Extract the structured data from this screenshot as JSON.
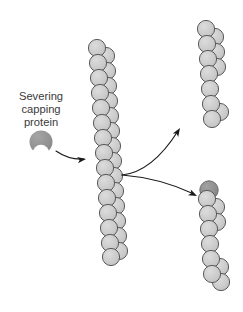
{
  "diagram": {
    "background_color": "#ffffff",
    "label": {
      "name": "severing-capping-protein-label",
      "lines": [
        "Severing",
        "capping",
        "protein"
      ],
      "line1": "Severing",
      "line2": "capping",
      "line3": "protein",
      "color": "#3a3a3a",
      "font_size_px": 11.2,
      "center_x": 41,
      "line_y": [
        97,
        110,
        123
      ]
    },
    "colors": {
      "subunit_fill": "#c9c9c9",
      "subunit_fill_light": "#d2d2d2",
      "subunit_stroke": "#5a5a5a",
      "protein_fill": "#8f8f8f",
      "protein_stroke": "#6e6e6e",
      "cap_fill": "#8c8c8c",
      "cap_stroke": "#6b6b6b",
      "arrow_color": "#1a1a1a",
      "text_color": "#3a3a3a",
      "background": "#ffffff"
    },
    "severing_protein_icon": {
      "name": "severing-capping-protein-icon",
      "shape": "crescent",
      "cx": 41,
      "cy": 142,
      "r": 11.5,
      "notch_cx": 41,
      "notch_cy": 153,
      "notch_r": 8.2,
      "fill": "#8f8f8f"
    },
    "filaments": [
      {
        "name": "intact-actin-filament",
        "role": "intact",
        "subunit_radius": 8.6,
        "subunits": [
          {
            "x": 97,
            "y": 48,
            "side": "left"
          },
          {
            "x": 106,
            "y": 56,
            "side": "right"
          },
          {
            "x": 98,
            "y": 63,
            "side": "left"
          },
          {
            "x": 107,
            "y": 71,
            "side": "right"
          },
          {
            "x": 99,
            "y": 78,
            "side": "left"
          },
          {
            "x": 108,
            "y": 86,
            "side": "right"
          },
          {
            "x": 100,
            "y": 93,
            "side": "left"
          },
          {
            "x": 109,
            "y": 101,
            "side": "right"
          },
          {
            "x": 101,
            "y": 108,
            "side": "left"
          },
          {
            "x": 110,
            "y": 116,
            "side": "right"
          },
          {
            "x": 102,
            "y": 123,
            "side": "left"
          },
          {
            "x": 111,
            "y": 131,
            "side": "right"
          },
          {
            "x": 103,
            "y": 138,
            "side": "left"
          },
          {
            "x": 112,
            "y": 146,
            "side": "right"
          },
          {
            "x": 104,
            "y": 153,
            "side": "left"
          },
          {
            "x": 113,
            "y": 161,
            "side": "right"
          },
          {
            "x": 105,
            "y": 168,
            "side": "left"
          },
          {
            "x": 114,
            "y": 176,
            "side": "right"
          },
          {
            "x": 106,
            "y": 183,
            "side": "left"
          },
          {
            "x": 115,
            "y": 191,
            "side": "right"
          },
          {
            "x": 107,
            "y": 198,
            "side": "left"
          },
          {
            "x": 116,
            "y": 206,
            "side": "right"
          },
          {
            "x": 108,
            "y": 213,
            "side": "left"
          },
          {
            "x": 117,
            "y": 221,
            "side": "right"
          },
          {
            "x": 109,
            "y": 228,
            "side": "left"
          },
          {
            "x": 118,
            "y": 236,
            "side": "right"
          },
          {
            "x": 110,
            "y": 243,
            "side": "left"
          },
          {
            "x": 119,
            "y": 251,
            "side": "right"
          },
          {
            "x": 111,
            "y": 257,
            "side": "left"
          }
        ]
      },
      {
        "name": "severed-fragment-uncapped",
        "role": "fragment-uncapped",
        "subunit_radius": 8.6,
        "subunits": [
          {
            "x": 206,
            "y": 29,
            "side": "left"
          },
          {
            "x": 215,
            "y": 37,
            "side": "right"
          },
          {
            "x": 207,
            "y": 44,
            "side": "left"
          },
          {
            "x": 216,
            "y": 52,
            "side": "right"
          },
          {
            "x": 208,
            "y": 59,
            "side": "left"
          },
          {
            "x": 217,
            "y": 67,
            "side": "right"
          },
          {
            "x": 209,
            "y": 74,
            "side": "left"
          },
          {
            "x": 210,
            "y": 89,
            "side": "left"
          },
          {
            "x": 211,
            "y": 104,
            "side": "left"
          },
          {
            "x": 220,
            "y": 112,
            "side": "right"
          },
          {
            "x": 212,
            "y": 119,
            "side": "left"
          }
        ]
      },
      {
        "name": "severed-fragment-capped",
        "role": "fragment-capped",
        "subunit_radius": 8.6,
        "cap": {
          "name": "capping-protein-cap",
          "cx": 209,
          "cy": 190,
          "r": 9.2,
          "fill": "#8c8c8c"
        },
        "subunits": [
          {
            "x": 207,
            "y": 199,
            "side": "left"
          },
          {
            "x": 216,
            "y": 207,
            "side": "right"
          },
          {
            "x": 208,
            "y": 214,
            "side": "left"
          },
          {
            "x": 217,
            "y": 222,
            "side": "right"
          },
          {
            "x": 209,
            "y": 229,
            "side": "left"
          },
          {
            "x": 210,
            "y": 244,
            "side": "left"
          },
          {
            "x": 211,
            "y": 259,
            "side": "left"
          },
          {
            "x": 220,
            "y": 267,
            "side": "right"
          },
          {
            "x": 212,
            "y": 274,
            "side": "left"
          },
          {
            "x": 221,
            "y": 282,
            "side": "right"
          }
        ]
      }
    ],
    "arrows": [
      {
        "name": "arrow-protein-to-filament",
        "path": "M 56 151 Q 69 160 84 159",
        "head_x": 86,
        "head_y": 159,
        "head_angle": 352,
        "color": "#1a1a1a"
      },
      {
        "name": "arrow-split-upper",
        "path": "M 122 175 Q 152 172 178 131",
        "head_x": 180,
        "head_y": 128,
        "head_angle": 302,
        "color": "#1a1a1a"
      },
      {
        "name": "arrow-split-lower",
        "path": "M 122 175 Q 160 178 194 194",
        "head_x": 197,
        "head_y": 196,
        "head_angle": 26,
        "color": "#1a1a1a"
      }
    ]
  }
}
